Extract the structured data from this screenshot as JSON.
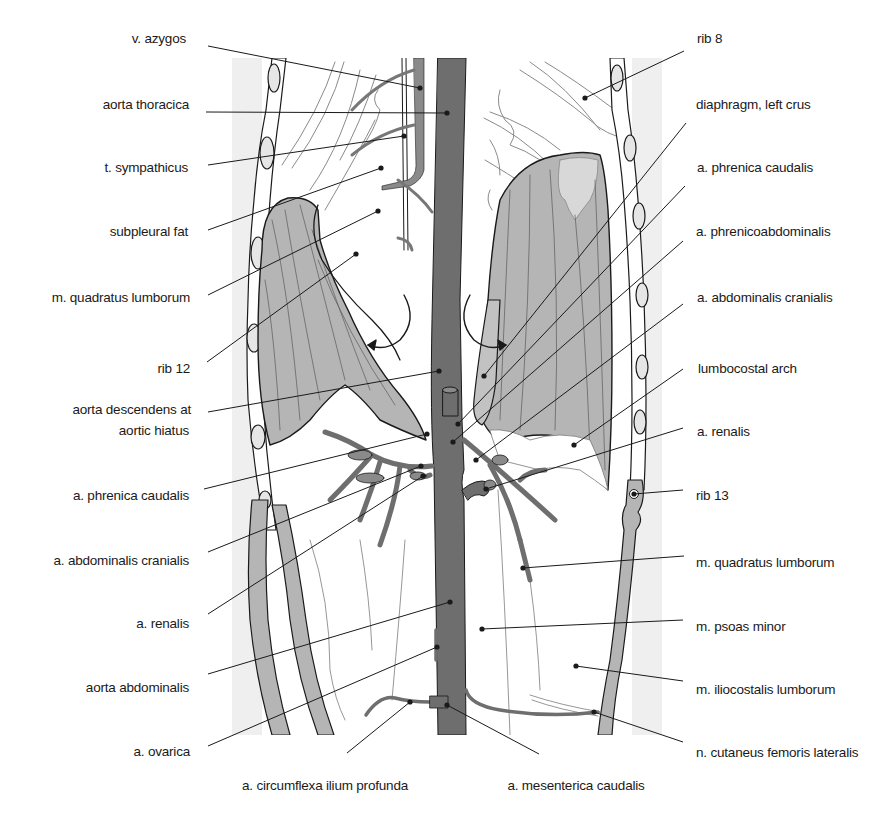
{
  "figure": {
    "colors": {
      "panel_background": "#efefef",
      "aorta": "#6e6e6e",
      "vessel": "#777777",
      "muscle_fill": "#b5b5b5",
      "muscle_fill_light": "#d2d2d2",
      "outline": "#1a1a1a",
      "leader_line": "#1a1a1a"
    },
    "labels_left": [
      {
        "text": "v. azygos",
        "x": 186,
        "y": 39
      },
      {
        "text": "aorta thoracica",
        "x": 189,
        "y": 105
      },
      {
        "text": "t. sympathicus",
        "x": 188,
        "y": 168
      },
      {
        "text": "subpleural fat",
        "x": 188,
        "y": 232
      },
      {
        "text": "m. quadratus lumborum",
        "x": 190,
        "y": 298
      },
      {
        "text": "rib 12",
        "x": 190,
        "y": 369
      },
      {
        "text": "aorta descendens at",
        "x": 191,
        "y": 410
      },
      {
        "text": "aortic hiatus",
        "x": 189,
        "y": 431
      },
      {
        "text": "a. phrenica caudalis",
        "x": 189,
        "y": 496
      },
      {
        "text": "a. abdominalis cranialis",
        "x": 189,
        "y": 561
      },
      {
        "text": "a. renalis",
        "x": 189,
        "y": 624
      },
      {
        "text": "aorta abdominalis",
        "x": 189,
        "y": 688
      },
      {
        "text": "a. ovarica",
        "x": 190,
        "y": 752
      }
    ],
    "labels_right": [
      {
        "text": "rib 8",
        "x": 697,
        "y": 39
      },
      {
        "text": "diaphragm, left crus",
        "x": 696,
        "y": 105
      },
      {
        "text": "a. phrenica caudalis",
        "x": 697,
        "y": 168
      },
      {
        "text": "a. phrenicoabdominalis",
        "x": 696,
        "y": 232
      },
      {
        "text": "a. abdominalis cranialis",
        "x": 697,
        "y": 298
      },
      {
        "text": "lumbocostal arch",
        "x": 698,
        "y": 369
      },
      {
        "text": "a. renalis",
        "x": 697,
        "y": 432
      },
      {
        "text": "rib 13",
        "x": 696,
        "y": 496
      },
      {
        "text": "m. quadratus lumborum",
        "x": 696,
        "y": 563
      },
      {
        "text": "m. psoas minor",
        "x": 696,
        "y": 627
      },
      {
        "text": "m. iliocostalis lumborum",
        "x": 696,
        "y": 690
      },
      {
        "text": "n. cutaneus femoris lateralis",
        "x": 696,
        "y": 753
      }
    ],
    "labels_bottom": [
      {
        "text": "a. circumflexa ilium profunda",
        "x": 325,
        "y": 786
      },
      {
        "text": "a. mesenterica caudalis",
        "x": 576,
        "y": 786
      }
    ],
    "leaders": [
      {
        "id": "v-azygos",
        "x1": 208,
        "y1": 46,
        "x2": 420,
        "y2": 88
      },
      {
        "id": "aorta-thoracica",
        "x1": 206,
        "y1": 112,
        "x2": 447,
        "y2": 113
      },
      {
        "id": "t-sympathicus",
        "x1": 208,
        "y1": 165,
        "x2": 404,
        "y2": 136
      },
      {
        "id": "subpleural-fat",
        "x1": 208,
        "y1": 230,
        "x2": 381,
        "y2": 168
      },
      {
        "id": "m-quadratus-lumborum-left",
        "x1": 208,
        "y1": 295,
        "x2": 378,
        "y2": 211
      },
      {
        "id": "rib-12",
        "x1": 207,
        "y1": 362,
        "x2": 356,
        "y2": 254
      },
      {
        "id": "aorta-descendens",
        "x1": 208,
        "y1": 412,
        "x2": 439,
        "y2": 371
      },
      {
        "id": "a-phrenica-caudalis-left",
        "x1": 204,
        "y1": 489,
        "x2": 427,
        "y2": 434
      },
      {
        "id": "a-abdominalis-cranialis-left",
        "x1": 208,
        "y1": 552,
        "x2": 421,
        "y2": 466
      },
      {
        "id": "a-renalis-left",
        "x1": 208,
        "y1": 614,
        "x2": 423,
        "y2": 476
      },
      {
        "id": "aorta-abdominalis",
        "x1": 208,
        "y1": 674,
        "x2": 450,
        "y2": 602
      },
      {
        "id": "a-ovarica",
        "x1": 208,
        "y1": 746,
        "x2": 437,
        "y2": 647
      },
      {
        "id": "rib-8",
        "x1": 684,
        "y1": 51,
        "x2": 585,
        "y2": 98
      },
      {
        "id": "diaphragm-left-crus",
        "x1": 686,
        "y1": 123,
        "x2": 484,
        "y2": 376
      },
      {
        "id": "a-phrenica-caudalis-right",
        "x1": 685,
        "y1": 186,
        "x2": 458,
        "y2": 424
      },
      {
        "id": "a-phrenicoabdominalis",
        "x1": 683,
        "y1": 241,
        "x2": 453,
        "y2": 442
      },
      {
        "id": "a-abdominalis-cranialis-right",
        "x1": 683,
        "y1": 304,
        "x2": 476,
        "y2": 460
      },
      {
        "id": "lumbocostal-arch",
        "x1": 683,
        "y1": 369,
        "x2": 574,
        "y2": 445
      },
      {
        "id": "a-renalis-right",
        "x1": 683,
        "y1": 428,
        "x2": 486,
        "y2": 489
      },
      {
        "id": "rib-13",
        "x1": 683,
        "y1": 490,
        "x2": 634,
        "y2": 494
      },
      {
        "id": "m-quadratus-lumborum-right",
        "x1": 684,
        "y1": 556,
        "x2": 523,
        "y2": 568
      },
      {
        "id": "m-psoas-minor",
        "x1": 683,
        "y1": 620,
        "x2": 482,
        "y2": 629
      },
      {
        "id": "m-iliocostalis-lumborum",
        "x1": 683,
        "y1": 681,
        "x2": 576,
        "y2": 666
      },
      {
        "id": "n-cutaneus-femoris-lateralis",
        "x1": 683,
        "y1": 742,
        "x2": 594,
        "y2": 712
      },
      {
        "id": "a-circumflexa-ilium-profunda",
        "x1": 347,
        "y1": 753,
        "x2": 410,
        "y2": 702
      },
      {
        "id": "a-mesenterica-caudalis",
        "x1": 539,
        "y1": 754,
        "x2": 447,
        "y2": 705
      }
    ]
  }
}
